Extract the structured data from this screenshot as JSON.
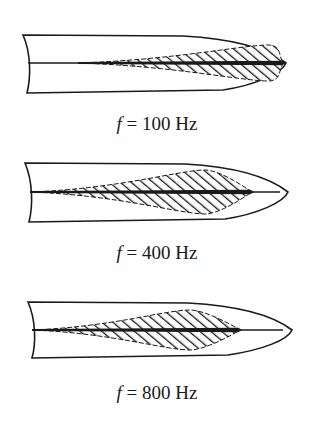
{
  "figure": {
    "type": "basilar-membrane-excitation-patterns",
    "panels": [
      {
        "id": "p100",
        "frequency_label_var": "f",
        "frequency_label_eq": "=",
        "frequency_label_value": "100 Hz",
        "outline": {
          "left_x": 23,
          "top_y": 35,
          "bottom_y": 93,
          "center_y": 63,
          "tip_x": 286
        },
        "excitation": {
          "start_x": 78,
          "peak_x": 268,
          "end_x": 284,
          "peak_half_height": 18,
          "tail_line_end_x": 284
        },
        "label_y": 113
      },
      {
        "id": "p400",
        "frequency_label_var": "f",
        "frequency_label_eq": "=",
        "frequency_label_value": "400 Hz",
        "outline": {
          "left_x": 25,
          "top_y": 163,
          "bottom_y": 222,
          "center_y": 192,
          "tip_x": 288
        },
        "excitation": {
          "start_x": 30,
          "peak_x": 205,
          "end_x": 252,
          "peak_half_height": 22,
          "tail_line_end_x": 280
        },
        "label_y": 242
      },
      {
        "id": "p800",
        "frequency_label_var": "f",
        "frequency_label_eq": "=",
        "frequency_label_value": "800 Hz",
        "outline": {
          "left_x": 28,
          "top_y": 302,
          "bottom_y": 358,
          "center_y": 330,
          "tip_x": 292
        },
        "excitation": {
          "start_x": 32,
          "peak_x": 190,
          "end_x": 240,
          "peak_half_height": 20,
          "tail_line_end_x": 283
        },
        "label_y": 382
      }
    ],
    "colors": {
      "ink": "#1a1a1a",
      "background": "#ffffff"
    }
  }
}
